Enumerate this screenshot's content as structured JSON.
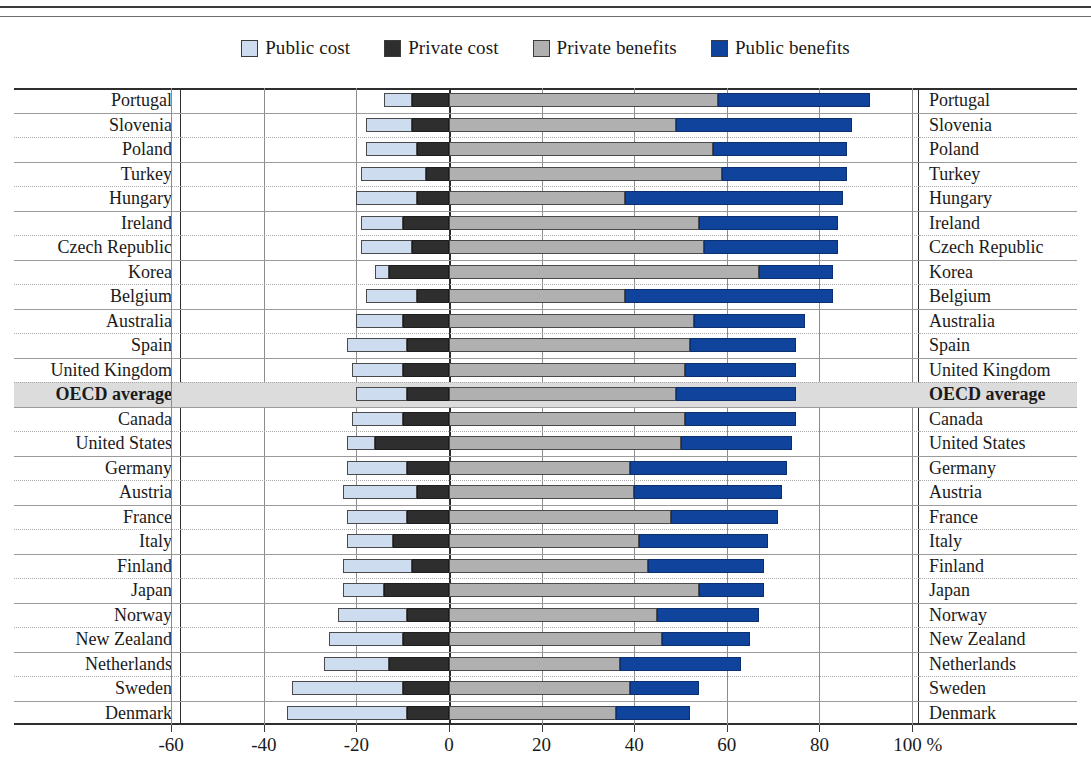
{
  "legend": {
    "items": [
      {
        "label": "Public cost",
        "key": "public_cost",
        "color": "#cddcef",
        "icon": "legend-swatch-icon"
      },
      {
        "label": "Private cost",
        "key": "private_cost",
        "color": "#2e2e2e",
        "icon": "legend-swatch-icon"
      },
      {
        "label": "Private benefits",
        "key": "private_benefits",
        "color": "#b0b0b0",
        "icon": "legend-swatch-icon"
      },
      {
        "label": "Public benefits",
        "key": "public_benefits",
        "color": "#10439b",
        "icon": "legend-swatch-icon"
      }
    ]
  },
  "axis": {
    "ticks": [
      -60,
      -40,
      -20,
      0,
      20,
      40,
      60,
      80,
      100
    ],
    "tick_labels": [
      "-60",
      "-40",
      "-20",
      "0",
      "20",
      "40",
      "60",
      "80",
      "100 %"
    ],
    "unit": "%",
    "min": -70,
    "max": 110
  },
  "highlight_row": "OECD average",
  "chart_data": {
    "type": "bar",
    "orientation": "horizontal",
    "stacked": true,
    "diverging": true,
    "title": "",
    "xlabel": "%",
    "ylabel": "",
    "xlim": [
      -70,
      110
    ],
    "grid": true,
    "legend_position": "top-center",
    "series": [
      {
        "name": "Public cost",
        "color": "#cddcef",
        "direction": "negative"
      },
      {
        "name": "Private cost",
        "color": "#2e2e2e",
        "direction": "negative"
      },
      {
        "name": "Private benefits",
        "color": "#b0b0b0",
        "direction": "positive"
      },
      {
        "name": "Public benefits",
        "color": "#10439b",
        "direction": "positive"
      }
    ],
    "categories": [
      "Portugal",
      "Slovenia",
      "Poland",
      "Turkey",
      "Hungary",
      "Ireland",
      "Czech Republic",
      "Korea",
      "Belgium",
      "Australia",
      "Spain",
      "United Kingdom",
      "OECD average",
      "Canada",
      "United States",
      "Germany",
      "Austria",
      "France",
      "Italy",
      "Finland",
      "Japan",
      "Norway",
      "New Zealand",
      "Netherlands",
      "Sweden",
      "Denmark"
    ],
    "rows": [
      {
        "country": "Portugal",
        "public_cost": -6,
        "private_cost": -8,
        "private_benefits": 58,
        "public_benefits": 33
      },
      {
        "country": "Slovenia",
        "public_cost": -10,
        "private_cost": -8,
        "private_benefits": 49,
        "public_benefits": 38
      },
      {
        "country": "Poland",
        "public_cost": -11,
        "private_cost": -7,
        "private_benefits": 57,
        "public_benefits": 29
      },
      {
        "country": "Turkey",
        "public_cost": -14,
        "private_cost": -5,
        "private_benefits": 59,
        "public_benefits": 27
      },
      {
        "country": "Hungary",
        "public_cost": -13,
        "private_cost": -7,
        "private_benefits": 38,
        "public_benefits": 47
      },
      {
        "country": "Ireland",
        "public_cost": -9,
        "private_cost": -10,
        "private_benefits": 54,
        "public_benefits": 30
      },
      {
        "country": "Czech Republic",
        "public_cost": -11,
        "private_cost": -8,
        "private_benefits": 55,
        "public_benefits": 29
      },
      {
        "country": "Korea",
        "public_cost": -3,
        "private_cost": -13,
        "private_benefits": 67,
        "public_benefits": 16
      },
      {
        "country": "Belgium",
        "public_cost": -11,
        "private_cost": -7,
        "private_benefits": 38,
        "public_benefits": 45
      },
      {
        "country": "Australia",
        "public_cost": -10,
        "private_cost": -10,
        "private_benefits": 53,
        "public_benefits": 24
      },
      {
        "country": "Spain",
        "public_cost": -13,
        "private_cost": -9,
        "private_benefits": 52,
        "public_benefits": 23
      },
      {
        "country": "United Kingdom",
        "public_cost": -11,
        "private_cost": -10,
        "private_benefits": 51,
        "public_benefits": 24
      },
      {
        "country": "OECD average",
        "public_cost": -11,
        "private_cost": -9,
        "private_benefits": 49,
        "public_benefits": 26
      },
      {
        "country": "Canada",
        "public_cost": -11,
        "private_cost": -10,
        "private_benefits": 51,
        "public_benefits": 24
      },
      {
        "country": "United States",
        "public_cost": -6,
        "private_cost": -16,
        "private_benefits": 50,
        "public_benefits": 24
      },
      {
        "country": "Germany",
        "public_cost": -13,
        "private_cost": -9,
        "private_benefits": 39,
        "public_benefits": 34
      },
      {
        "country": "Austria",
        "public_cost": -16,
        "private_cost": -7,
        "private_benefits": 40,
        "public_benefits": 32
      },
      {
        "country": "France",
        "public_cost": -13,
        "private_cost": -9,
        "private_benefits": 48,
        "public_benefits": 23
      },
      {
        "country": "Italy",
        "public_cost": -10,
        "private_cost": -12,
        "private_benefits": 41,
        "public_benefits": 28
      },
      {
        "country": "Finland",
        "public_cost": -15,
        "private_cost": -8,
        "private_benefits": 43,
        "public_benefits": 25
      },
      {
        "country": "Japan",
        "public_cost": -9,
        "private_cost": -14,
        "private_benefits": 54,
        "public_benefits": 14
      },
      {
        "country": "Norway",
        "public_cost": -15,
        "private_cost": -9,
        "private_benefits": 45,
        "public_benefits": 22
      },
      {
        "country": "New Zealand",
        "public_cost": -16,
        "private_cost": -10,
        "private_benefits": 46,
        "public_benefits": 19
      },
      {
        "country": "Netherlands",
        "public_cost": -14,
        "private_cost": -13,
        "private_benefits": 37,
        "public_benefits": 26
      },
      {
        "country": "Sweden",
        "public_cost": -24,
        "private_cost": -10,
        "private_benefits": 39,
        "public_benefits": 15
      },
      {
        "country": "Denmark",
        "public_cost": -26,
        "private_cost": -9,
        "private_benefits": 36,
        "public_benefits": 16
      }
    ]
  }
}
